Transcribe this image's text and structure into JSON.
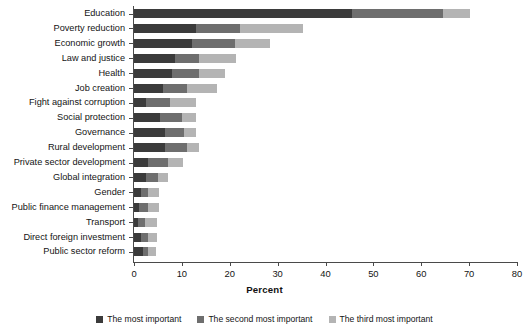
{
  "chart_data": {
    "type": "bar",
    "orientation": "horizontal",
    "stacked": true,
    "title": "",
    "xlabel": "Percent",
    "ylabel": "",
    "xlim": [
      0,
      80
    ],
    "xticks": [
      0,
      10,
      20,
      30,
      40,
      50,
      60,
      70,
      80
    ],
    "grid": false,
    "legend_position": "bottom",
    "categories": [
      "Education",
      "Poverty reduction",
      "Economic growth",
      "Law and justice",
      "Health",
      "Job creation",
      "Fight against corruption",
      "Social protection",
      "Governance",
      "Rural development",
      "Private sector development",
      "Global integration",
      "Gender",
      "Public finance management",
      "Transport",
      "Direct foreign investment",
      "Public sector reform"
    ],
    "series": [
      {
        "name": "The most important",
        "color": "#3b3b3b",
        "values": [
          45.5,
          13.0,
          12.2,
          8.5,
          8.0,
          6.0,
          2.5,
          5.5,
          6.5,
          6.5,
          3.0,
          2.5,
          1.5,
          1.0,
          0.8,
          1.5,
          1.8
        ]
      },
      {
        "name": "The second most important",
        "color": "#6e6e6e",
        "values": [
          19.0,
          9.2,
          8.8,
          5.0,
          5.5,
          5.0,
          5.0,
          4.5,
          4.0,
          4.5,
          4.0,
          2.5,
          1.5,
          2.0,
          1.5,
          1.5,
          1.2
        ]
      },
      {
        "name": "The third most important",
        "color": "#b4b4b4",
        "values": [
          5.6,
          13.0,
          7.4,
          7.8,
          5.5,
          6.3,
          5.5,
          3.0,
          2.5,
          2.5,
          3.2,
          2.1,
          2.2,
          2.3,
          2.6,
          1.8,
          1.7
        ]
      }
    ],
    "totals": [
      70.1,
      35.2,
      28.4,
      21.3,
      19.0,
      17.3,
      13.0,
      13.0,
      13.0,
      13.5,
      10.2,
      7.1,
      5.2,
      5.3,
      4.9,
      4.8,
      4.7
    ]
  },
  "axis": {
    "x_title": "Percent"
  }
}
